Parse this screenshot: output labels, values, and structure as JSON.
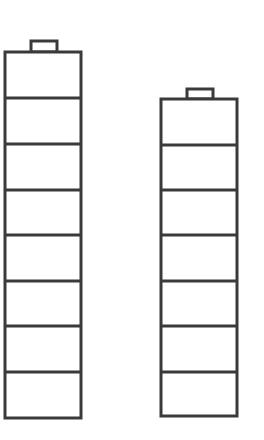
{
  "diagram": {
    "stroke_color": "#3a3a3a",
    "background": "#ffffff",
    "stacks": [
      {
        "name": "left-stack",
        "cells": 8
      },
      {
        "name": "right-stack",
        "cells": 7
      }
    ]
  }
}
